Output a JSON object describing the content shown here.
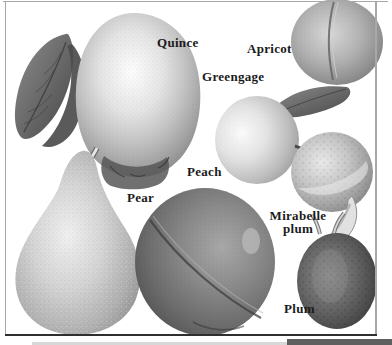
{
  "illustration": {
    "type": "botanical-plate-engraving",
    "subject": "Stone fruits and pome fruits",
    "labels": {
      "quince": "Quince",
      "apricot": "Apricot",
      "greengage": "Greengage",
      "peach": "Peach",
      "pear": "Pear",
      "mirabelle_line1": "Mirabelle",
      "mirabelle_line2": "plum",
      "plum": "Plum"
    },
    "fruits": [
      "Quince",
      "Apricot",
      "Greengage",
      "Peach",
      "Pear",
      "Mirabelle plum",
      "Plum"
    ],
    "colors": {
      "label_text": "#1b1b1b",
      "frame_light": "#a8a8a8",
      "frame_dark": "#2f2f2f",
      "bottom_band_dark": "#5f5f5f",
      "bottom_band_light": "#d8d8d8",
      "page_bg": "#ffffff"
    }
  }
}
